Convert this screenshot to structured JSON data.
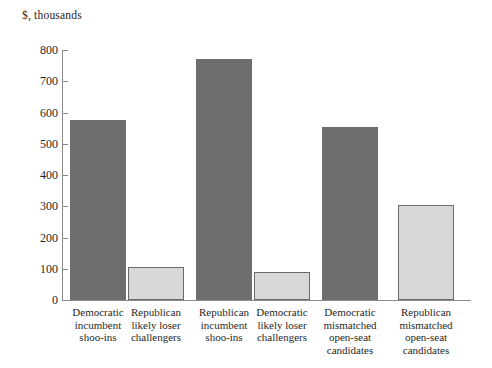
{
  "chart_data": {
    "type": "bar",
    "title": "",
    "subtitle": "",
    "xlabel": "",
    "ylabel": "$, thousands",
    "ylim": [
      0,
      800
    ],
    "ytick_step": 100,
    "yticks": [
      0,
      100,
      200,
      300,
      400,
      500,
      600,
      700,
      800
    ],
    "ytick_labels": [
      "0",
      "100",
      "200",
      "300",
      "400",
      "500",
      "600",
      "700",
      "800"
    ],
    "grid": false,
    "legend": "none",
    "categories": [
      "Democratic incumbent shoo-ins",
      "Republican likely loser challengers",
      "Republican incumbent shoo-ins",
      "Democratic likely loser challengers",
      "Democratic mismatched open-seat candidates",
      "Republican mismatched open-seat candidates"
    ],
    "category_lines": [
      [
        "Democratic",
        "incumbent",
        "shoo-ins"
      ],
      [
        "Republican",
        "likely loser",
        "challengers"
      ],
      [
        "Republican",
        "incumbent",
        "shoo-ins"
      ],
      [
        "Democratic",
        "likely loser",
        "challengers"
      ],
      [
        "Democratic",
        "mismatched",
        "open-seat",
        "candidates"
      ],
      [
        "Republican",
        "mismatched",
        "open-seat",
        "candidates"
      ]
    ],
    "values": [
      577,
      107,
      770,
      90,
      555,
      305
    ],
    "bar_styles": [
      "dark",
      "light",
      "dark",
      "light",
      "dark",
      "light"
    ],
    "colors": {
      "dark_bar": "#6e6e6e",
      "light_bar": "#d8d8d8",
      "light_bar_border": "#6b6b6b",
      "axis": "#8a8a8a",
      "text": "#1f1f1f",
      "background": "#ffffff"
    }
  }
}
